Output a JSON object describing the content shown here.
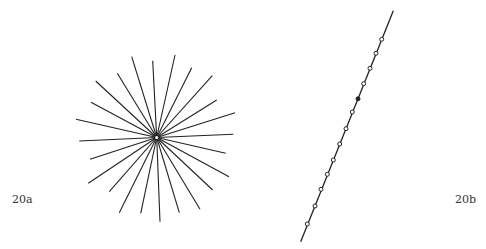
{
  "figure_a": {
    "label": "20a",
    "center": [
      156.7,
      137.5
    ],
    "stroke": "#222222",
    "ray_endpoints": [
      [
        131.7,
        56.7
      ],
      [
        152.7,
        60.7
      ],
      [
        175.0,
        55.0
      ],
      [
        191.7,
        67.7
      ],
      [
        212.3,
        75.7
      ],
      [
        216.7,
        100.0
      ],
      [
        235.0,
        112.7
      ],
      [
        233.3,
        134.3
      ],
      [
        225.7,
        153.3
      ],
      [
        229.0,
        176.7
      ],
      [
        212.7,
        190.0
      ],
      [
        200.0,
        209.3
      ],
      [
        179.3,
        212.7
      ],
      [
        160.0,
        221.7
      ],
      [
        140.7,
        213.3
      ],
      [
        119.3,
        212.7
      ],
      [
        109.3,
        191.7
      ],
      [
        88.3,
        183.3
      ],
      [
        90.0,
        159.3
      ],
      [
        79.3,
        141.0
      ],
      [
        76.0,
        119.3
      ],
      [
        91.0,
        102.3
      ],
      [
        95.7,
        81.0
      ],
      [
        117.3,
        73.3
      ]
    ]
  },
  "figure_b": {
    "label": "20b",
    "line_start": [
      393.3,
      10.7
    ],
    "line_end": [
      300.7,
      241.7
    ],
    "stroke": "#222222",
    "open_points": [
      [
        381.7,
        39.3
      ],
      [
        376.0,
        53.3
      ],
      [
        370.0,
        68.3
      ],
      [
        363.7,
        83.7
      ],
      [
        352.3,
        112.0
      ],
      [
        346.0,
        128.7
      ],
      [
        339.7,
        144.0
      ],
      [
        333.3,
        160.0
      ],
      [
        327.3,
        174.3
      ],
      [
        321.0,
        189.3
      ],
      [
        315.0,
        206.0
      ],
      [
        307.3,
        224.0
      ]
    ],
    "filled_points": [
      [
        358.0,
        98.8
      ]
    ]
  }
}
